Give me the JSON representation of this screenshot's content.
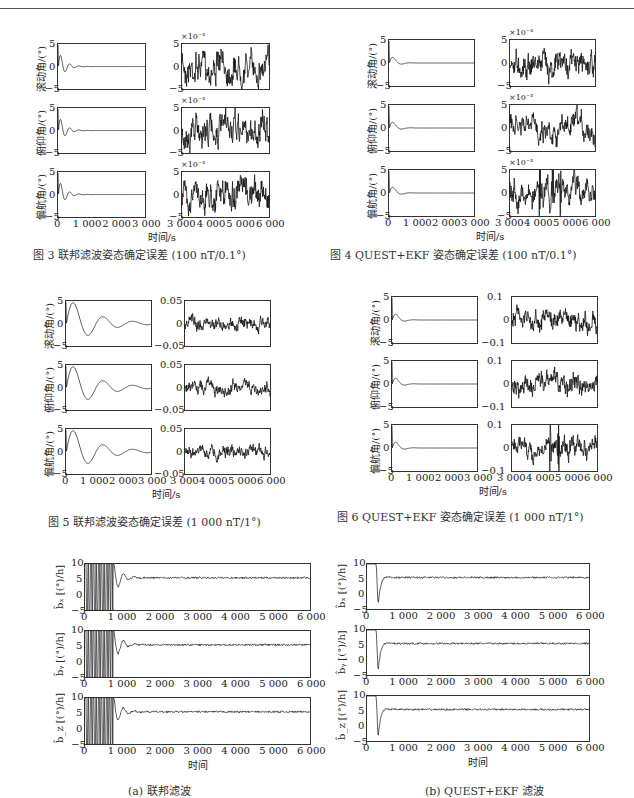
{
  "page": {
    "header_rule": true
  },
  "figures": [
    {
      "id": "fig3",
      "caption": "图 3  联邦滤波姿态确定误差 (100 nT/0.1°)",
      "xlabel": "时间/s",
      "left_xticks": [
        "0",
        "1 000",
        "2 000",
        "3 000"
      ],
      "right_xticks": [
        "3 000",
        "4 000",
        "5 000",
        "6 000"
      ],
      "rows": [
        {
          "ylabel": "滚动角/(°)",
          "left_yticks": [
            "5",
            "0",
            "−5"
          ],
          "right_yticks": [
            "5",
            "0",
            "−5"
          ],
          "right_multiplier": "×10⁻³"
        },
        {
          "ylabel": "俯仰角/(°)",
          "left_yticks": [
            "5",
            "0",
            "−5"
          ],
          "right_yticks": [
            "5",
            "0",
            "−5"
          ],
          "right_multiplier": "×10⁻³"
        },
        {
          "ylabel": "偏航角/(°)",
          "left_yticks": [
            "5",
            "0",
            "−5"
          ],
          "right_yticks": [
            "5",
            "0",
            "−5"
          ],
          "right_multiplier": "×10⁻³"
        }
      ]
    },
    {
      "id": "fig4",
      "caption": "图 4  QUEST+EKF 姿态确定误差 (100 nT/0.1°)",
      "xlabel": "时间/s",
      "left_xticks": [
        "0",
        "1 000",
        "2 000",
        "3 000"
      ],
      "right_xticks": [
        "3 000",
        "4 000",
        "5 000",
        "6 000"
      ],
      "rows": [
        {
          "ylabel": "滚动角/(°)",
          "left_yticks": [
            "5",
            "0",
            "−5"
          ],
          "right_yticks": [
            "5",
            "0",
            "−5"
          ],
          "right_multiplier": "×10⁻³"
        },
        {
          "ylabel": "俯仰角/(°)",
          "left_yticks": [
            "5",
            "0",
            "−5"
          ],
          "right_yticks": [
            "5",
            "0",
            "−5"
          ],
          "right_multiplier": "×10⁻³"
        },
        {
          "ylabel": "偏航角/(°)",
          "left_yticks": [
            "5",
            "0",
            "−5"
          ],
          "right_yticks": [
            "5",
            "0",
            "−5"
          ],
          "right_multiplier": "×10⁻³"
        }
      ]
    },
    {
      "id": "fig5",
      "caption": "图 5  联邦滤波姿态确定误差 (1 000 nT/1°)",
      "xlabel": "时间/s",
      "left_xticks": [
        "0",
        "1 000",
        "2 000",
        "3 000"
      ],
      "right_xticks": [
        "3 000",
        "4 000",
        "5 000",
        "6 000"
      ],
      "rows": [
        {
          "ylabel": "滚动角/(°)",
          "left_yticks": [
            "5",
            "0",
            "−5"
          ],
          "right_yticks": [
            "0.05",
            "0",
            "−0.05"
          ]
        },
        {
          "ylabel": "俯仰角/(°)",
          "left_yticks": [
            "5",
            "0",
            "−5"
          ],
          "right_yticks": [
            "0.05",
            "0",
            "−0.05"
          ]
        },
        {
          "ylabel": "偏航角/(°)",
          "left_yticks": [
            "5",
            "0",
            "−5"
          ],
          "right_yticks": [
            "0.05",
            "0",
            "−0.05"
          ]
        }
      ]
    },
    {
      "id": "fig6",
      "caption": "图 6  QUEST+EKF 姿态确定误差 (1 000 nT/1°)",
      "xlabel": "时间/s",
      "left_xticks": [
        "0",
        "1 000",
        "2 000",
        "3 000"
      ],
      "right_xticks": [
        "3 000",
        "4 000",
        "5 000",
        "6 000"
      ],
      "rows": [
        {
          "ylabel": "滚动角/(°)",
          "left_yticks": [
            "5",
            "0",
            "−5"
          ],
          "right_yticks": [
            "0.1",
            "0",
            "−0.1"
          ]
        },
        {
          "ylabel": "俯仰角/(°)",
          "left_yticks": [
            "5",
            "0",
            "−5"
          ],
          "right_yticks": [
            "0.1",
            "0",
            "−0.1"
          ]
        },
        {
          "ylabel": "偏航角/(°)",
          "left_yticks": [
            "5",
            "0",
            "−5"
          ],
          "right_yticks": [
            "0.1",
            "0",
            "−0.1"
          ]
        }
      ]
    },
    {
      "id": "fig7a",
      "caption": "(a) 联邦滤波",
      "xlabel": "时间",
      "xticks": [
        "0",
        "1 000",
        "2 000",
        "3 000",
        "4 000",
        "5 000",
        "6 000"
      ],
      "rows": [
        {
          "ylabel": "b̂ₓ [(°)/h]",
          "yticks": [
            "10",
            "5",
            "0",
            "−5"
          ]
        },
        {
          "ylabel": "b̂ᵧ [(°)/h]",
          "yticks": [
            "10",
            "5",
            "0",
            "−5"
          ]
        },
        {
          "ylabel": "b̂_z [(°)/h]",
          "yticks": [
            "10",
            "5",
            "0",
            "−5"
          ]
        }
      ]
    },
    {
      "id": "fig7b",
      "caption": "(b) QUEST+EKF 滤波",
      "xlabel": "时间",
      "xticks": [
        "0",
        "1 000",
        "2 000",
        "3 000",
        "4 000",
        "5 000",
        "6 000"
      ],
      "rows": [
        {
          "ylabel": "b̂ₓ [(°)/h]",
          "yticks": [
            "10",
            "5",
            "0",
            "−5"
          ]
        },
        {
          "ylabel": "b̂ᵧ [(°)/h]",
          "yticks": [
            "10",
            "5",
            "0",
            "−5"
          ]
        },
        {
          "ylabel": "b̂_z [(°)/h]",
          "yticks": [
            "10",
            "5",
            "0",
            "−5"
          ]
        }
      ]
    }
  ],
  "chart_data": [
    {
      "type": "line",
      "title": "图 3 联邦滤波姿态确定误差 (100 nT/0.1°)",
      "xlabel": "时间/s",
      "ylabels": [
        "滚动角/(°)",
        "俯仰角/(°)",
        "偏航角/(°)"
      ],
      "left_xlim": [
        0,
        3000
      ],
      "left_ylim": [
        -5,
        5
      ],
      "right_xlim": [
        3000,
        6000
      ],
      "right_ylim": [
        -0.005,
        0.005
      ],
      "description": "Left: damped oscillation from ~-5 settling to 0 by ~600 s; Right: noise ±0.005"
    },
    {
      "type": "line",
      "title": "图 4 QUEST+EKF 姿态确定误差 (100 nT/0.1°)",
      "xlabel": "时间/s",
      "ylabels": [
        "滚动角/(°)",
        "俯仰角/(°)",
        "偏航角/(°)"
      ],
      "left_xlim": [
        0,
        3000
      ],
      "left_ylim": [
        -5,
        5
      ],
      "right_xlim": [
        3000,
        6000
      ],
      "right_ylim": [
        -0.005,
        0.005
      ],
      "description": "Left: fast overshoot ~1.5 settling to 0 by ~300 s; Right: noise ±0.005 with spikes in yaw near 4000-4800 s"
    },
    {
      "type": "line",
      "title": "图 5 联邦滤波姿态确定误差 (1 000 nT/1°)",
      "xlabel": "时间/s",
      "ylabels": [
        "滚动角/(°)",
        "俯仰角/(°)",
        "偏航角/(°)"
      ],
      "left_xlim": [
        0,
        3000
      ],
      "left_ylim": [
        -5,
        5
      ],
      "right_xlim": [
        3000,
        6000
      ],
      "right_ylim": [
        -0.05,
        0.05
      ],
      "description": "Left: damped oscillation peak ~2.2 settling by ~1500-2500 s; Right: noise ±0.03"
    },
    {
      "type": "line",
      "title": "图 6 QUEST+EKF 姿态确定误差 (1 000 nT/1°)",
      "xlabel": "时间/s",
      "ylabels": [
        "滚动角/(°)",
        "俯仰角/(°)",
        "偏航角/(°)"
      ],
      "left_xlim": [
        0,
        3000
      ],
      "left_ylim": [
        -5,
        5
      ],
      "right_xlim": [
        3000,
        6000
      ],
      "right_ylim": [
        -0.1,
        0.1
      ],
      "description": "Left: overshoot ~1.5 settling by ~300 s; Right: noise ±0.07, yaw spike ~0.1 near 4400 s"
    },
    {
      "type": "line",
      "title": "(a) 联邦滤波",
      "xlabel": "时间",
      "ylabels": [
        "b̂ₓ [(°)/h]",
        "b̂ᵧ [(°)/h]",
        "b̂_z [(°)/h]"
      ],
      "xlim": [
        0,
        6000
      ],
      "ylim": [
        -5,
        10
      ],
      "description": "Large oscillations before ~800-1000 s then settles near 5.5"
    },
    {
      "type": "line",
      "title": "(b) QUEST+EKF 滤波",
      "xlabel": "时间",
      "ylabels": [
        "b̂ₓ [(°)/h]",
        "b̂ᵧ [(°)/h]",
        "b̂_z [(°)/h]"
      ],
      "xlim": [
        0,
        6000
      ],
      "ylim": [
        -5,
        10
      ],
      "description": "Dip to ~-4 near 300 s then settles near 5.5 by ~500 s"
    }
  ]
}
